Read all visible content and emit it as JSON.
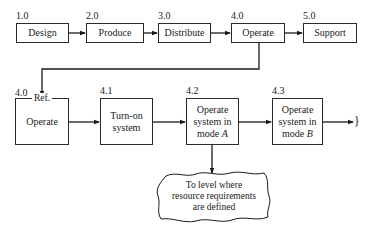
{
  "top_row": [
    {
      "id": "1.0",
      "label": "Design"
    },
    {
      "id": "2.0",
      "label": "Produce"
    },
    {
      "id": "3.0",
      "label": "Distribute"
    },
    {
      "id": "4.0",
      "label": "Operate"
    },
    {
      "id": "5.0",
      "label": "Support"
    }
  ],
  "bottom_row": [
    {
      "id": "4.0",
      "ref": "Ref.",
      "label": "Operate"
    },
    {
      "id": "4.1",
      "label_line1": "Turn-on",
      "label_line2": "system"
    },
    {
      "id": "4.2",
      "label_line1": "Operate",
      "label_line2": "system in",
      "label_line3_prefix": "mode ",
      "label_line3_var": "A"
    },
    {
      "id": "4.3",
      "label_line1": "Operate",
      "label_line2": "system in",
      "label_line3_prefix": "mode ",
      "label_line3_var": "B"
    }
  ],
  "continuation_glyph": "}",
  "cloud": {
    "line1": "To level where",
    "line2": "resource requirements",
    "line3": "are defined"
  },
  "colors": {
    "line": "#2a2a2a",
    "background": "#ffffff"
  }
}
